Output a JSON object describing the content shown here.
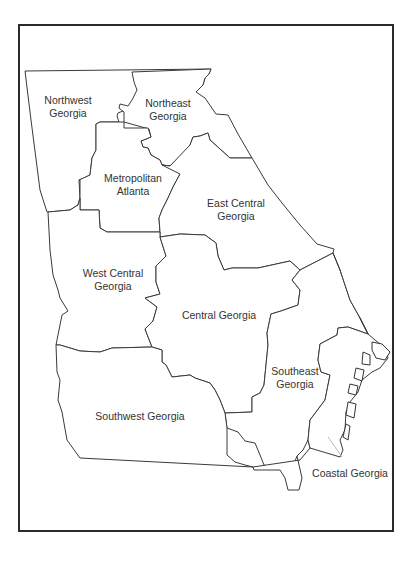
{
  "map": {
    "title": "Georgia Regions",
    "colors": {
      "frame": "#2b2b2b",
      "border": "#3a3a3a",
      "fill": "#ffffff",
      "text": "#333333"
    },
    "regions": [
      {
        "id": "northwest",
        "line1": "Northwest",
        "line2": "Georgia"
      },
      {
        "id": "northeast",
        "line1": "Northeast",
        "line2": "Georgia"
      },
      {
        "id": "metro-atlanta",
        "line1": "Metropolitan",
        "line2": "Atlanta"
      },
      {
        "id": "east-central",
        "line1": "East Central",
        "line2": "Georgia"
      },
      {
        "id": "west-central",
        "line1": "West Central",
        "line2": "Georgia"
      },
      {
        "id": "central",
        "line1": "Central Georgia",
        "line2": ""
      },
      {
        "id": "southeast",
        "line1": "Southeast",
        "line2": "Georgia"
      },
      {
        "id": "southwest",
        "line1": "Southwest Georgia",
        "line2": ""
      },
      {
        "id": "coastal",
        "line1": "Coastal Georgia",
        "line2": ""
      }
    ]
  }
}
